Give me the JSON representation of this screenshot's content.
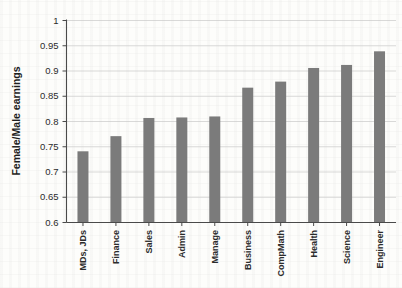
{
  "chart_data": {
    "type": "bar",
    "title": "",
    "xlabel": "",
    "ylabel": "Female/Male earnings",
    "ylim": [
      0.6,
      1.0
    ],
    "yticks": [
      "0.6",
      "0.65",
      "0.7",
      "0.75",
      "0.8",
      "0.85",
      "0.9",
      "0.95",
      "1"
    ],
    "ytick_values": [
      0.6,
      0.65,
      0.7,
      0.75,
      0.8,
      0.85,
      0.9,
      0.95,
      1.0
    ],
    "grid": true,
    "legend": "none",
    "bar_color": "#7b7b7b",
    "categories": [
      "MDs, JDs",
      "Finance",
      "Sales",
      "Admin",
      "Manage",
      "Business",
      "CompMath",
      "Health",
      "Science",
      "Engineer"
    ],
    "values": [
      0.74,
      0.77,
      0.806,
      0.807,
      0.809,
      0.866,
      0.878,
      0.905,
      0.911,
      0.938
    ]
  }
}
